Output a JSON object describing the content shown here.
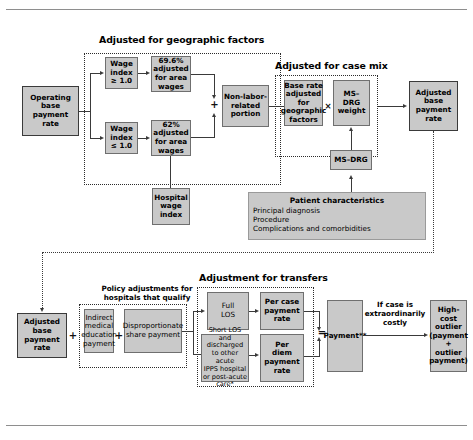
{
  "diagram": {
    "sections": [
      {
        "key": "geo",
        "label": "Adjusted for geographic factors"
      },
      {
        "key": "casemix",
        "label": "Adjusted for case mix"
      },
      {
        "key": "transfers",
        "label": "Adjustment for transfers"
      },
      {
        "key": "policy",
        "label": "Policy adjustments for\nhospitals that qualify"
      }
    ],
    "section_titles": {
      "geographic": "Adjusted for geographic factors",
      "case_mix": "Adjusted for case mix",
      "transfers": "Adjustment for transfers",
      "policy_line1": "Policy adjustments for",
      "policy_line2": "hospitals that qualify"
    },
    "nodes": {
      "operating_base": "Operating\nbase\npayment\nrate",
      "wage_index_high": "Wage\nindex\n≥ 1.0",
      "wage_index_low": "Wage\nindex\n≤ 1.0",
      "adj_696": "69.6%\nadjusted\nfor area\nwages",
      "adj_62": "62%\nadjusted\nfor area\nwages",
      "non_labor": "Non-labor-\nrelated\nportion",
      "hospital_wage_index": "Hospital\nwage\nindex",
      "base_rate_geo": "Base rate\nadjusted\nfor\ngeographic\nfactors",
      "msdrg_weight": "MS–DRG\nweight",
      "msdrg": "MS–DRG",
      "adjusted_base_top": "Adjusted\nbase\npayment\nrate",
      "adjusted_base_bottom": "Adjusted\nbase\npayment\nrate",
      "ime": "Indirect\nmedical\neducation\npayment",
      "dsh": "Disproportionate\nshare payment",
      "full_los": "Full\nLOS",
      "per_case": "Per case\npayment\nrate",
      "short_los": "Short LOS and\ndischarged\nto other acute\nIPPS hospital\nor post-acute\ncare*",
      "per_diem": "Per\ndiem\npayment\nrate",
      "payment": "Payment**",
      "high_cost_outlier": "High-\ncost\noutlier\n(payment\n+\noutlier\npayment)"
    },
    "patient_characteristics": {
      "title": "Patient characteristics",
      "items": [
        "Principal diagnosis",
        "Procedure",
        "Complications and comorbidities"
      ]
    },
    "annotations": {
      "if_extraordinary_l1": "If case is",
      "if_extraordinary_l2": "extraordinarily",
      "if_extraordinary_l3": "costly"
    },
    "operators": {
      "plus1": "+",
      "plus2": "+",
      "plus3": "+",
      "plus4": "+",
      "plus5": "+",
      "times": "×",
      "equals": "="
    },
    "colors": {
      "box_fill": "#c9c9c9",
      "box_fill_light": "#d2d2d2",
      "border": "#6f6f6f",
      "line": "#3a3a3a",
      "text": "#000000",
      "background": "#ffffff"
    }
  }
}
